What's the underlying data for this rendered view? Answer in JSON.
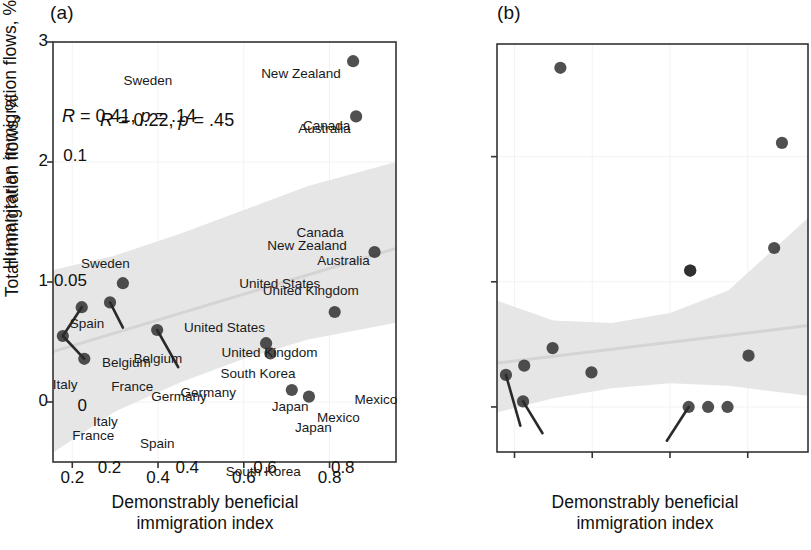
{
  "figure": {
    "panels": [
      {
        "tag": "(a)",
        "stat_R_label": "R",
        "stat_R_value": "= 0.41,",
        "stat_p_label": "p",
        "stat_p_value": "= .14",
        "xlabel": "Demonstrably beneficial\nimmigration index",
        "ylabel": "Total immigration flows, %",
        "xticks": [
          "0.2",
          "0.4",
          "0.6",
          "0.8"
        ],
        "yticks": [
          "0",
          "1",
          "2",
          "3"
        ]
      },
      {
        "tag": "(b)",
        "stat_R_label": "R",
        "stat_R_value": "= 0.22,",
        "stat_p_label": "p",
        "stat_p_value": "= .45",
        "xlabel": "Demonstrably beneficial\nimmigration index",
        "ylabel": "Humanitarian immigration flows, %",
        "xticks": [
          "0.2",
          "0.4",
          "0.6",
          "0.8"
        ],
        "yticks": [
          "0.00",
          "0.05",
          "0.10"
        ]
      }
    ]
  },
  "colors": {
    "point": "#2a2a2a",
    "band": "#e6e6e6",
    "trendline": "#d4d4d4",
    "axis": "#333333",
    "grid": "#f2f2f2",
    "text": "#1a1a1a"
  },
  "chart_data": [
    {
      "type": "scatter",
      "panel": "(a)",
      "title": "",
      "xlabel": "Demonstrably beneficial immigration index",
      "ylabel": "Total immigration flows, %",
      "xlim": [
        0.155,
        0.955
      ],
      "ylim": [
        -0.5,
        3.0
      ],
      "xticks": [
        0.2,
        0.4,
        0.6,
        0.8
      ],
      "yticks": [
        0,
        1,
        2,
        3
      ],
      "grid": true,
      "legend": null,
      "annotation": "R = 0.41, p = .14",
      "correlation_R": 0.41,
      "p_value": 0.14,
      "points": [
        {
          "label": "New Zealand",
          "x": 0.855,
          "y": 2.84,
          "label_dx": -92,
          "label_dy": 14
        },
        {
          "label": "Australia",
          "x": 0.862,
          "y": 2.38,
          "label_dx": -58,
          "label_dy": 14
        },
        {
          "label": "Canada",
          "x": 0.905,
          "y": 1.25,
          "label_dx": -78,
          "label_dy": -18
        },
        {
          "label": "Sweden",
          "x": 0.318,
          "y": 0.99,
          "label_dx": -42,
          "label_dy": -18
        },
        {
          "label": "Spain",
          "x": 0.222,
          "y": 0.79,
          "label_dx": -12,
          "label_dy": 18
        },
        {
          "label": "Belgium",
          "x": 0.288,
          "y": 0.83,
          "label_dx": -8,
          "label_dy": 62
        },
        {
          "label": "United Kingdom",
          "x": 0.812,
          "y": 0.75,
          "label_dx": -72,
          "label_dy": -20
        },
        {
          "label": "Germany",
          "x": 0.398,
          "y": 0.6,
          "label_dx": -6,
          "label_dy": 68
        },
        {
          "label": "Italy",
          "x": 0.178,
          "y": 0.55,
          "label_dx": -10,
          "label_dy": 50
        },
        {
          "label": "United States",
          "x": 0.652,
          "y": 0.49,
          "label_dx": -82,
          "label_dy": -14
        },
        {
          "label": "South Korea",
          "x": 0.662,
          "y": 0.405,
          "label_dx": -50,
          "label_dy": 22
        },
        {
          "label": "France",
          "x": 0.228,
          "y": 0.36,
          "label_dx": -12,
          "label_dy": 78
        },
        {
          "label": "Japan",
          "x": 0.712,
          "y": 0.1,
          "label_dx": -20,
          "label_dy": 18
        },
        {
          "label": "Mexico",
          "x": 0.752,
          "y": 0.045,
          "label_dx": 8,
          "label_dy": 22
        }
      ],
      "leaders": [
        {
          "label": "Spain",
          "from": [
            0.222,
            0.79
          ],
          "to": [
            0.178,
            0.55
          ]
        },
        {
          "label": "Italy",
          "from": [
            0.178,
            0.55
          ],
          "to": [
            0.228,
            0.36
          ]
        },
        {
          "label": "Belgium",
          "from": [
            0.288,
            0.83
          ],
          "to": [
            0.318,
            0.62
          ]
        },
        {
          "label": "Germany",
          "from": [
            0.398,
            0.6
          ],
          "to": [
            0.447,
            0.29
          ]
        }
      ],
      "band": {
        "description": "shaded 95% confidence band, widening to the right",
        "x": [
          0.155,
          0.3,
          0.45,
          0.6,
          0.75,
          0.955
        ],
        "upper": [
          1.1,
          1.22,
          1.4,
          1.6,
          1.8,
          2.0
        ],
        "lower": [
          -0.42,
          -0.08,
          0.16,
          0.36,
          0.52,
          0.66
        ]
      },
      "trendline": {
        "x": [
          0.155,
          0.955
        ],
        "y": [
          0.42,
          1.28
        ]
      }
    },
    {
      "type": "scatter",
      "panel": "(b)",
      "title": "",
      "xlabel": "Demonstrably beneficial immigration index",
      "ylabel": "Humanitarian immigration flows, %",
      "xlim": [
        0.155,
        0.955
      ],
      "ylim": [
        -0.018,
        0.145
      ],
      "xticks": [
        0.2,
        0.4,
        0.6,
        0.8
      ],
      "yticks": [
        0.0,
        0.05,
        0.1
      ],
      "grid": true,
      "legend": null,
      "annotation": "R = 0.22, p = .45",
      "correlation_R": 0.22,
      "p_value": 0.45,
      "points": [
        {
          "label": "Sweden",
          "x": 0.318,
          "y": 0.1355,
          "label_dx": -32,
          "label_dy": 14
        },
        {
          "label": "Canada",
          "x": 0.888,
          "y": 0.1055,
          "label_dx": -74,
          "label_dy": -16
        },
        {
          "label": "Australia",
          "x": 0.868,
          "y": 0.0635,
          "label_dx": -52,
          "label_dy": 14
        },
        {
          "label": "New Zealand",
          "x": 0.652,
          "y": 0.0545,
          "label_dx": -18,
          "label_dy": -24
        },
        {
          "label": "United States",
          "x": 0.652,
          "y": 0.0545,
          "label_dx": -46,
          "label_dy": 14
        },
        {
          "label": "United Kingdom",
          "x": 0.802,
          "y": 0.0205,
          "label_dx": -122,
          "label_dy": -2
        },
        {
          "label": "Belgium",
          "x": 0.298,
          "y": 0.0235,
          "label_dx": -14,
          "label_dy": 12
        },
        {
          "label": "France",
          "x": 0.225,
          "y": 0.0165,
          "label_dx": -8,
          "label_dy": 22
        },
        {
          "label": "Germany",
          "x": 0.398,
          "y": 0.0138,
          "label_dx": -6,
          "label_dy": 22
        },
        {
          "label": "Italy",
          "x": 0.178,
          "y": 0.0128,
          "label_dx": -8,
          "label_dy": 48
        },
        {
          "label": "Spain",
          "x": 0.222,
          "y": 0.0022,
          "label_dx": 22,
          "label_dy": 44
        },
        {
          "label": "South Korea",
          "x": 0.648,
          "y": 0.0,
          "label_dx": -58,
          "label_dy": 66
        },
        {
          "label": "Japan",
          "x": 0.698,
          "y": 0.0,
          "label_dx": -8,
          "label_dy": 22
        },
        {
          "label": "Mexico",
          "x": 0.748,
          "y": 0.0,
          "label_dx": 32,
          "label_dy": -6
        }
      ],
      "leaders": [
        {
          "label": "Italy",
          "from": [
            0.178,
            0.0128
          ],
          "to": [
            0.215,
            -0.0075
          ]
        },
        {
          "label": "Spain",
          "from": [
            0.222,
            0.0022
          ],
          "to": [
            0.272,
            -0.0105
          ]
        },
        {
          "label": "South Korea",
          "from": [
            0.648,
            0.0
          ],
          "to": [
            0.592,
            -0.0135
          ]
        }
      ],
      "band": {
        "description": "shaded 95% confidence band, hourglass shaped",
        "x": [
          0.155,
          0.3,
          0.45,
          0.6,
          0.75,
          0.955
        ],
        "upper": [
          0.0425,
          0.0345,
          0.0335,
          0.0375,
          0.0465,
          0.0755
        ],
        "lower": [
          -0.0022,
          0.0035,
          0.0075,
          0.0095,
          0.0085,
          0.0045
        ]
      },
      "trendline": {
        "x": [
          0.155,
          0.955
        ],
        "y": [
          0.0175,
          0.0325
        ]
      }
    }
  ]
}
